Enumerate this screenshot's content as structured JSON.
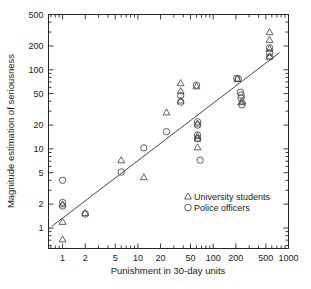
{
  "chart_data": {
    "type": "scatter",
    "title": "",
    "xlabel": "Punishment in 30-day units",
    "ylabel": "Magnitude estimation of seriousness",
    "xscale": "log",
    "yscale": "log",
    "xlim": [
      0.65,
      1000
    ],
    "ylim": [
      0.55,
      500
    ],
    "grid": false,
    "xticks": [
      1,
      2,
      5,
      10,
      20,
      50,
      100,
      200,
      500,
      1000
    ],
    "xticklabels": [
      "1",
      "2",
      "5",
      "10",
      "20",
      "50",
      "100",
      "200",
      "500",
      "1000"
    ],
    "yticks": [
      1,
      2,
      5,
      10,
      20,
      50,
      100,
      200,
      500
    ],
    "yticklabels": [
      "1",
      "2",
      "5",
      "10",
      "20",
      "50",
      "100",
      "200",
      "500"
    ],
    "legend_position": "lower right",
    "legend": [
      {
        "label": "University students",
        "marker": "triangle"
      },
      {
        "label": "Police officers",
        "marker": "circle"
      }
    ],
    "series": [
      {
        "name": "University students",
        "marker": "triangle",
        "points": [
          [
            1.0,
            2.0
          ],
          [
            1.0,
            1.2
          ],
          [
            1.0,
            0.72
          ],
          [
            2.0,
            1.55
          ],
          [
            6.0,
            7.2
          ],
          [
            12.0,
            4.4
          ],
          [
            24.0,
            29.0
          ],
          [
            37.0,
            68.0
          ],
          [
            37.0,
            54.0
          ],
          [
            37.0,
            41.0
          ],
          [
            60.0,
            62.0
          ],
          [
            62.0,
            21.0
          ],
          [
            62.0,
            14.5
          ],
          [
            62.0,
            13.5
          ],
          [
            62.0,
            10.5
          ],
          [
            210.0,
            77.0
          ],
          [
            235.0,
            39.0
          ],
          [
            245.0,
            40.0
          ],
          [
            560.0,
            300.0
          ],
          [
            560.0,
            240.0
          ],
          [
            560.0,
            185.0
          ],
          [
            560.0,
            148.0
          ]
        ]
      },
      {
        "name": "Police officers",
        "marker": "circle",
        "points": [
          [
            1.0,
            4.0
          ],
          [
            1.0,
            2.1
          ],
          [
            1.0,
            1.9
          ],
          [
            2.0,
            1.5
          ],
          [
            6.0,
            5.1
          ],
          [
            12.0,
            10.3
          ],
          [
            24.0,
            16.5
          ],
          [
            37.0,
            47.0
          ],
          [
            37.0,
            39.0
          ],
          [
            60.0,
            64.0
          ],
          [
            62.0,
            22.0
          ],
          [
            62.0,
            20.0
          ],
          [
            62.0,
            15.0
          ],
          [
            62.0,
            13.5
          ],
          [
            67.0,
            7.2
          ],
          [
            205.0,
            78.0
          ],
          [
            215.0,
            77.0
          ],
          [
            230.0,
            52.0
          ],
          [
            235.0,
            48.0
          ],
          [
            235.0,
            44.0
          ],
          [
            240.0,
            36.0
          ],
          [
            560.0,
            190.0
          ],
          [
            560.0,
            165.0
          ],
          [
            560.0,
            145.0
          ]
        ]
      }
    ],
    "fit_line": {
      "x": [
        0.72,
        760
      ],
      "y": [
        1.05,
        165
      ],
      "description": "regression line through log-log data"
    }
  }
}
